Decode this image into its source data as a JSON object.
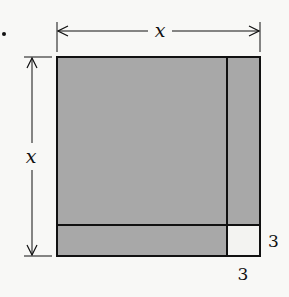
{
  "diagram": {
    "top_dimension_label": "x",
    "left_dimension_label": "x",
    "right_small_label": "3",
    "bottom_small_label": "3",
    "bullet": "•",
    "colors": {
      "shaded": "#a8a8a8",
      "small_square": "#f3f3f1",
      "stroke": "#111111",
      "background": "#f8f8f6"
    },
    "regions": [
      {
        "name": "x-by-x square",
        "shaded": true
      },
      {
        "name": "right strip 3-by-x",
        "shaded": true
      },
      {
        "name": "bottom strip x-by-3",
        "shaded": true
      },
      {
        "name": "3-by-3 square",
        "shaded": false
      }
    ]
  }
}
